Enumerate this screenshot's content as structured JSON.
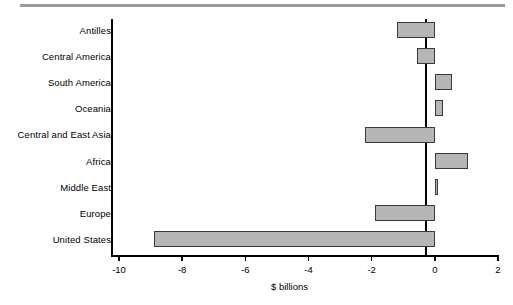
{
  "figure": {
    "top_rule": "decorative-rule"
  },
  "chart_data": {
    "type": "bar",
    "orientation": "horizontal",
    "title": "",
    "xlabel": "$ billions",
    "ylabel": "",
    "categories": [
      "Antilles",
      "Central America",
      "South America",
      "Oceania",
      "Central and East Asia",
      "Africa",
      "Middle East",
      "Europe",
      "United States"
    ],
    "values": [
      -1.2,
      -0.55,
      0.55,
      0.25,
      -2.2,
      1.05,
      0.1,
      -1.9,
      -8.9
    ],
    "xlim": [
      -10,
      2
    ],
    "xticks": [
      -10,
      -8,
      -6,
      -4,
      -2,
      0,
      2
    ],
    "xtick_labels": [
      "-10",
      "-8",
      "-6",
      "-4",
      "-2",
      "0",
      "2"
    ],
    "grid": false,
    "legend": null,
    "bar_color": "#b5b5b5",
    "bar_edge_color": "#3a3a3a",
    "axis_color": "#000000"
  }
}
